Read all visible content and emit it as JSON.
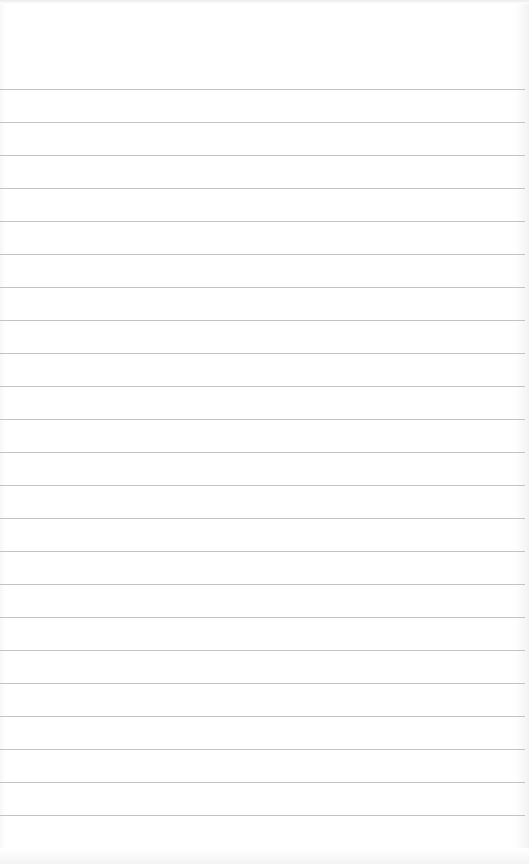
{
  "page": {
    "type": "lined-notepad",
    "background_color": "#ffffff",
    "rule_color": "#b8b8b8",
    "first_rule_y": 89,
    "rule_spacing": 33,
    "rule_count": 24
  }
}
